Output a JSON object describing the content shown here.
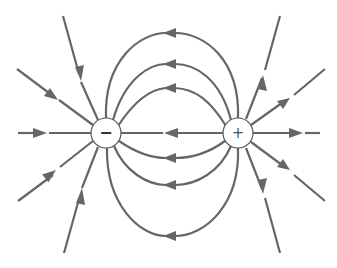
{
  "diagram": {
    "line_color": "#666666",
    "background": "#ffffff",
    "charges": [
      {
        "name": "negative-charge",
        "sign": "−",
        "cx": 106,
        "cy": 133,
        "r": 15
      },
      {
        "name": "positive-charge",
        "sign": "+",
        "cx": 238,
        "cy": 133,
        "r": 15
      }
    ],
    "field_line_direction": "from positive (+) to negative (−)",
    "connecting_arcs": {
      "top_peaks_y": [
        33,
        64,
        88
      ],
      "bottom_peaks_y": [
        158,
        185,
        236
      ],
      "arrow_direction": "left"
    },
    "radial_lines": {
      "negative_charge": "arrows pointing inward",
      "positive_charge": "arrows pointing outward"
    }
  }
}
